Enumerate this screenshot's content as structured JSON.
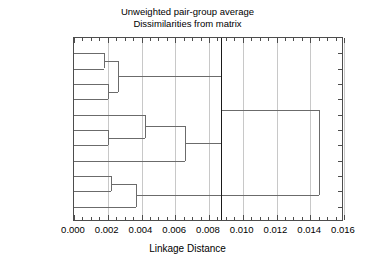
{
  "chart_data": {
    "type": "dendrogram",
    "title": "Unweighted pair-group average",
    "subtitle": "Dissimilarities from matrix",
    "xlabel": "Linkage Distance",
    "ylabel": "",
    "xlim": [
      0.0,
      0.016
    ],
    "xticks": [
      0.0,
      0.002,
      0.004,
      0.006,
      0.008,
      0.01,
      0.012,
      0.014,
      0.016
    ],
    "xticklabels": [
      "0.000",
      "0.002",
      "0.004",
      "0.006",
      "0.008",
      "0.010",
      "0.012",
      "0.014",
      "0.016"
    ],
    "xtick_minor_step": 0.0005,
    "grid": true,
    "grid_axis": "x",
    "legend": null,
    "leaves": [
      "Apache",
      "Distributed",
      "ARP",
      "Fork",
      "Hardware",
      "Security",
      "Software",
      "Rootkit",
      "Remote",
      "FTP",
      "Vulnerability"
    ],
    "merges": [
      {
        "id": "m1",
        "label": "Apache + Distributed",
        "children": [
          "Apache",
          "Distributed"
        ],
        "distance": 0.0018
      },
      {
        "id": "m2",
        "label": "ARP + Fork",
        "children": [
          "ARP",
          "Fork"
        ],
        "distance": 0.002
      },
      {
        "id": "m3",
        "label": "(Apache,Distributed) + (ARP,Fork)",
        "children": [
          "m1",
          "m2"
        ],
        "distance": 0.0026
      },
      {
        "id": "m4",
        "label": "Security + Software",
        "children": [
          "Security",
          "Software"
        ],
        "distance": 0.002
      },
      {
        "id": "m5",
        "label": "Hardware + (Security,Software)",
        "children": [
          "Hardware",
          "m4"
        ],
        "distance": 0.0042
      },
      {
        "id": "m6",
        "label": "(Hardware,Security,Software) + Rootkit",
        "children": [
          "m5",
          "Rootkit"
        ],
        "distance": 0.0066
      },
      {
        "id": "m7",
        "label": "Remote + FTP",
        "children": [
          "Remote",
          "FTP"
        ],
        "distance": 0.0022
      },
      {
        "id": "m8",
        "label": "(Remote,FTP) + Vulnerability",
        "children": [
          "m7",
          "Vulnerability"
        ],
        "distance": 0.0037
      },
      {
        "id": "m9",
        "label": "Top cluster + Middle cluster",
        "children": [
          "m3",
          "m6"
        ],
        "distance": 0.0087
      },
      {
        "id": "m10",
        "label": "Root",
        "children": [
          "m9",
          "m8"
        ],
        "distance": 0.0145
      }
    ],
    "threshold_line": {
      "value": 0.0087,
      "color": "#1a1a1a"
    },
    "colors": {
      "line": "#6b6b6b",
      "axis": "#4d4d4d",
      "grid": "#c8c8c8",
      "threshold": "#1a1a1a",
      "background": "#ffffff",
      "text": "#000000"
    }
  }
}
